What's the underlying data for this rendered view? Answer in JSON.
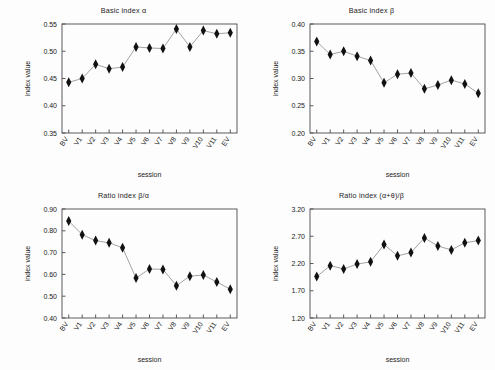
{
  "figure": {
    "background_color": "#fdfdfd",
    "marker_color": "#111111",
    "line_color": "#8a8a8a",
    "axis_color": "#4a4a4a"
  },
  "chart_data": [
    {
      "type": "line",
      "panel": "top-left",
      "title": "Basic index α",
      "xlabel": "session",
      "ylabel": "index value",
      "categories": [
        "BV",
        "V1",
        "V2",
        "V3",
        "V4",
        "V5",
        "V6",
        "V7",
        "V8",
        "V9",
        "V10",
        "V11",
        "EV"
      ],
      "values": [
        0.443,
        0.45,
        0.476,
        0.468,
        0.471,
        0.508,
        0.506,
        0.505,
        0.541,
        0.508,
        0.538,
        0.532,
        0.534
      ],
      "ylim": [
        0.35,
        0.55
      ],
      "yticks": [
        "0.35",
        "0.40",
        "0.45",
        "0.50",
        "0.55"
      ],
      "ytick_values": [
        0.35,
        0.4,
        0.45,
        0.5,
        0.55
      ],
      "grid": false,
      "legend": null
    },
    {
      "type": "line",
      "panel": "top-right",
      "title": "Basic index β",
      "xlabel": "session",
      "ylabel": "index value",
      "categories": [
        "BV",
        "V1",
        "V2",
        "V3",
        "V4",
        "V5",
        "V6",
        "V7",
        "V8",
        "V9",
        "V10",
        "V11",
        "EV"
      ],
      "values": [
        0.368,
        0.344,
        0.35,
        0.341,
        0.333,
        0.292,
        0.308,
        0.31,
        0.281,
        0.288,
        0.297,
        0.29,
        0.273
      ],
      "ylim": [
        0.2,
        0.4
      ],
      "yticks": [
        "0.20",
        "0.25",
        "0.30",
        "0.35",
        "0.40"
      ],
      "ytick_values": [
        0.2,
        0.25,
        0.3,
        0.35,
        0.4
      ],
      "grid": false,
      "legend": null
    },
    {
      "type": "line",
      "panel": "bottom-left",
      "title": "Ratio index β/α",
      "xlabel": "session",
      "ylabel": "index value",
      "categories": [
        "BV",
        "V1",
        "V2",
        "V3",
        "V4",
        "V5",
        "V6",
        "V7",
        "V8",
        "V9",
        "V10",
        "V11",
        "EV"
      ],
      "values": [
        0.845,
        0.782,
        0.755,
        0.745,
        0.722,
        0.583,
        0.625,
        0.623,
        0.548,
        0.592,
        0.597,
        0.565,
        0.532
      ],
      "ylim": [
        0.4,
        0.9
      ],
      "yticks": [
        "0.40",
        "0.50",
        "0.60",
        "0.70",
        "0.80",
        "0.90"
      ],
      "ytick_values": [
        0.4,
        0.5,
        0.6,
        0.7,
        0.8,
        0.9
      ],
      "grid": false,
      "legend": null
    },
    {
      "type": "line",
      "panel": "bottom-right",
      "title": "Ratio index (α+θ)/β",
      "xlabel": "session",
      "ylabel": "index value",
      "categories": [
        "BV",
        "V1",
        "V2",
        "V3",
        "V4",
        "V5",
        "V6",
        "V7",
        "V8",
        "V9",
        "V10",
        "V11",
        "EV"
      ],
      "values": [
        1.96,
        2.16,
        2.1,
        2.19,
        2.23,
        2.55,
        2.34,
        2.4,
        2.67,
        2.52,
        2.45,
        2.58,
        2.62
      ],
      "ylim": [
        1.2,
        3.2
      ],
      "yticks": [
        "1.20",
        "1.70",
        "2.20",
        "2.70",
        "3.20"
      ],
      "ytick_values": [
        1.2,
        1.7,
        2.2,
        2.7,
        3.2
      ],
      "grid": false,
      "legend": null
    }
  ]
}
